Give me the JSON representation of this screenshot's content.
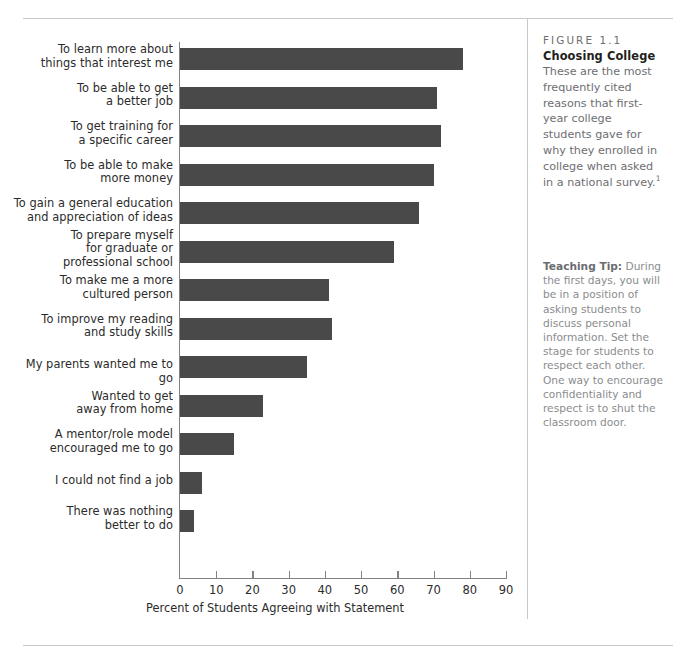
{
  "figure": {
    "kicker": "FIGURE 1.1",
    "title": "Choosing College",
    "caption": "These are the most frequently cited reasons that first-year college students gave for why they enrolled in college when asked in a national survey.",
    "caption_footnote_marker": "1"
  },
  "teaching_tip": {
    "label": "Teaching Tip:",
    "text": " During the first days, you will be in a position of asking students to discuss personal information. Set the stage for students to respect each other. One way to encourage confidentiality and respect is to shut the classroom door."
  },
  "chart_data": {
    "type": "bar",
    "orientation": "horizontal",
    "title": "Choosing College",
    "xlabel": "Percent of Students Agreeing with Statement",
    "ylabel": "",
    "xlim": [
      0,
      90
    ],
    "xticks": [
      0,
      10,
      20,
      30,
      40,
      50,
      60,
      70,
      80,
      90
    ],
    "grid": false,
    "legend": "none",
    "bar_color": "#494949",
    "categories": [
      "To learn more about things that interest me",
      "To be able to get a better job",
      "To get training for a specific career",
      "To be able to make more money",
      "To gain a general education and appreciation of ideas",
      "To prepare myself for graduate or professional school",
      "To make me a more cultured person",
      "To improve my reading and study skills",
      "My parents wanted me to go",
      "Wanted to get away from home",
      "A mentor/role model encouraged me to go",
      "I could not find a job",
      "There was nothing better to do"
    ],
    "values": [
      78,
      71,
      72,
      70,
      66,
      59,
      41,
      42,
      35,
      23,
      15,
      6,
      4
    ],
    "bars": [
      {
        "label_lines": [
          "To learn more about",
          "things that interest me"
        ],
        "value": 78
      },
      {
        "label_lines": [
          "To be able to get",
          "a better job"
        ],
        "value": 71
      },
      {
        "label_lines": [
          "To get training for",
          "a specific career"
        ],
        "value": 72
      },
      {
        "label_lines": [
          "To be able to make",
          "more money"
        ],
        "value": 70
      },
      {
        "label_lines": [
          "To gain a general education",
          "and appreciation of ideas"
        ],
        "value": 66
      },
      {
        "label_lines": [
          "To prepare myself",
          "for graduate or",
          "professional school"
        ],
        "value": 59
      },
      {
        "label_lines": [
          "To make me a more",
          "cultured person"
        ],
        "value": 41
      },
      {
        "label_lines": [
          "To improve my reading",
          "and study skills"
        ],
        "value": 42
      },
      {
        "label_lines": [
          "My parents wanted me to go"
        ],
        "value": 35
      },
      {
        "label_lines": [
          "Wanted to get",
          "away from home"
        ],
        "value": 23
      },
      {
        "label_lines": [
          "A mentor/role model",
          "encouraged me to go"
        ],
        "value": 15
      },
      {
        "label_lines": [
          "I could not find a job"
        ],
        "value": 6
      },
      {
        "label_lines": [
          "There was nothing",
          "better to do"
        ],
        "value": 4
      }
    ]
  }
}
